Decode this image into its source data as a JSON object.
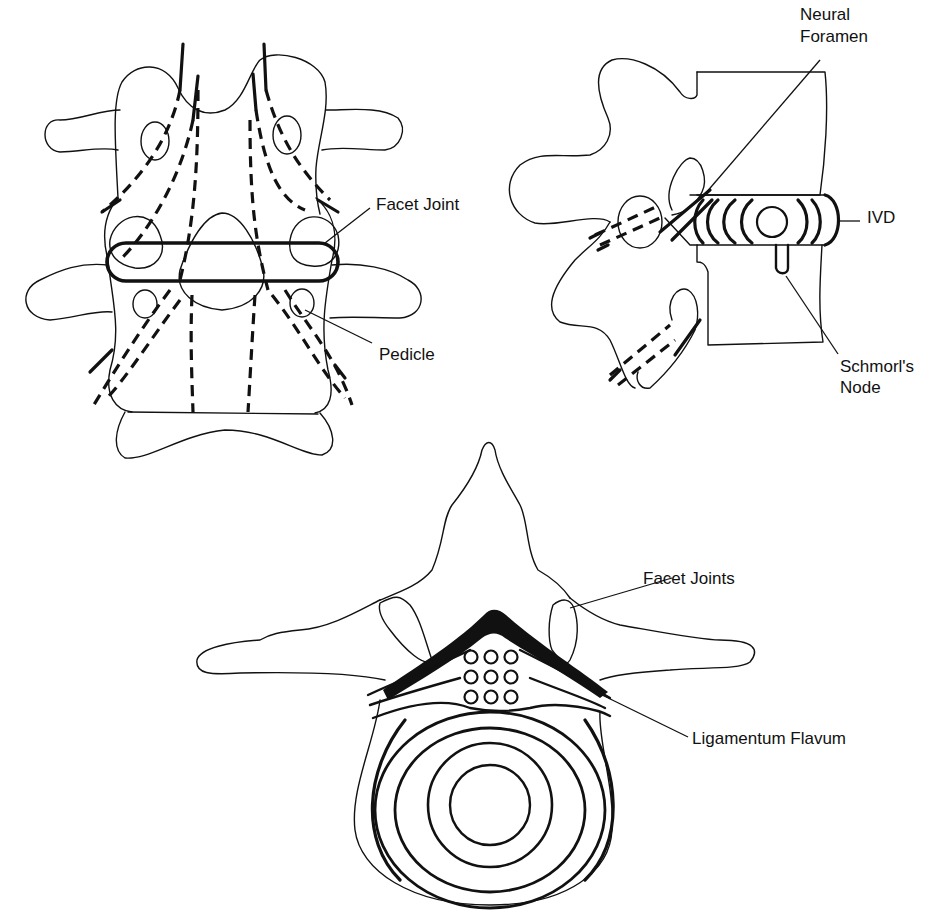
{
  "figures": {
    "posterior_view": {
      "labels": {
        "facet_joint": "Facet Joint",
        "pedicle": "Pedicle"
      }
    },
    "lateral_view": {
      "labels": {
        "neural_foramen_line1": "Neural",
        "neural_foramen_line2": "Foramen",
        "ivd": "IVD",
        "schmorls_node_line1": "Schmorl's",
        "schmorls_node_line2": "Node"
      }
    },
    "axial_view": {
      "labels": {
        "facet_joints": "Facet Joints",
        "ligamentum_flavum": "Ligamentum Flavum"
      }
    }
  },
  "colors": {
    "ink": "#111111",
    "background": "#ffffff"
  }
}
